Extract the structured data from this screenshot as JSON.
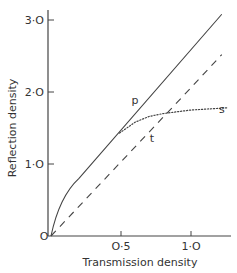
{
  "chart_data": {
    "type": "line",
    "title": "",
    "xlabel": "Transmission density",
    "ylabel": "Reflection density",
    "xlim": [
      0,
      1.3
    ],
    "ylim": [
      0,
      3.1
    ],
    "x_ticks": [
      {
        "value": 0,
        "label": "O"
      },
      {
        "value": 0.5,
        "label": "O·5"
      },
      {
        "value": 1.0,
        "label": "1·O"
      }
    ],
    "y_ticks": [
      {
        "value": 1.0,
        "label": "1·O"
      },
      {
        "value": 2.0,
        "label": "2·O"
      },
      {
        "value": 3.0,
        "label": "3·O"
      }
    ],
    "grid": false,
    "legend": "none (curves labeled inline)",
    "series": [
      {
        "name": "p",
        "style": "solid",
        "x": [
          0,
          0.05,
          0.1,
          0.2,
          0.5,
          0.8,
          1.0,
          1.22
        ],
        "y": [
          0,
          0.35,
          0.57,
          0.8,
          1.47,
          2.13,
          2.58,
          3.08
        ]
      },
      {
        "name": "t",
        "style": "dashed",
        "x": [
          0,
          0.5,
          1.0,
          1.22
        ],
        "y": [
          0,
          1.03,
          2.06,
          2.52
        ]
      },
      {
        "name": "s",
        "style": "dotted",
        "x": [
          0.49,
          0.6,
          0.7,
          0.8,
          1.0,
          1.26
        ],
        "y": [
          1.43,
          1.58,
          1.66,
          1.7,
          1.75,
          1.78
        ]
      }
    ],
    "annotations": [
      {
        "text": "p",
        "x": 0.6,
        "y": 1.84
      },
      {
        "text": "t",
        "x": 0.72,
        "y": 1.3
      },
      {
        "text": "s",
        "x": 1.22,
        "y": 1.71
      }
    ]
  }
}
